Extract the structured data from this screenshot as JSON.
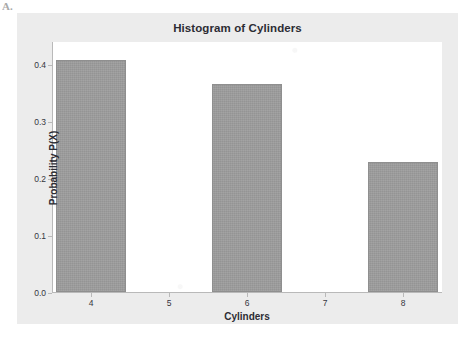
{
  "page": {
    "scan_mark": "A."
  },
  "chart_data": {
    "type": "bar",
    "title": "Histogram of Cylinders",
    "xlabel": "Cylinders",
    "ylabel": "Probability P(X)",
    "categories": [
      "4",
      "5",
      "6",
      "7",
      "8"
    ],
    "values": [
      0.406,
      0.0,
      0.365,
      0.0,
      0.228
    ],
    "bars": [
      {
        "category": "4",
        "value": 0.406
      },
      {
        "category": "6",
        "value": 0.365
      },
      {
        "category": "8",
        "value": 0.228
      }
    ],
    "xlim": [
      3.5,
      8.5
    ],
    "ylim": [
      0.0,
      0.44
    ],
    "x_ticks": [
      "4",
      "5",
      "6",
      "7",
      "8"
    ],
    "y_ticks": [
      "0.0",
      "0.1",
      "0.2",
      "0.3",
      "0.4"
    ],
    "y_tick_values": [
      0.0,
      0.1,
      0.2,
      0.3,
      0.4
    ],
    "grid": false,
    "legend": "none",
    "bar_color": "#9a9a9a",
    "bar_edge_color": "#8f8f8f",
    "plot_background": "#ffffff",
    "figure_background": "#ececec",
    "axis_color": "#b9b9b9",
    "text_color": "#2c2c34"
  }
}
